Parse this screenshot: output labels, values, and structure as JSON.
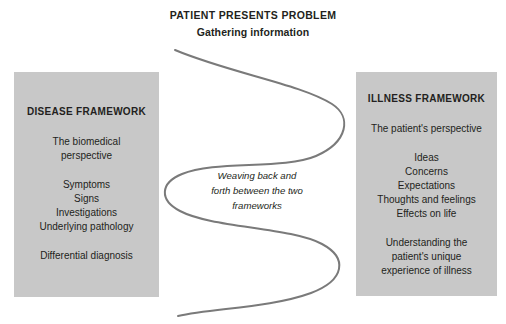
{
  "header": {
    "title": "PATIENT PRESENTS PROBLEM",
    "subtitle": "Gathering information"
  },
  "disease_framework": {
    "title": "DISEASE FRAMEWORK",
    "lead_line1": "The biomedical",
    "lead_line2": "perspective",
    "items": [
      "Symptoms",
      "Signs",
      "Investigations",
      "Underlying pathology"
    ],
    "note": "Differential diagnosis"
  },
  "illness_framework": {
    "title": "ILLNESS FRAMEWORK",
    "lead": "The patient's perspective",
    "items": [
      "Ideas",
      "Concerns",
      "Expectations",
      "Thoughts and feelings",
      "Effects on life"
    ],
    "note_line1": "Understanding the",
    "note_line2": "patient's unique",
    "note_line3": "experience of illness"
  },
  "center_caption": {
    "line1": "Weaving back and",
    "line2": "forth between the two",
    "line3": "frameworks"
  },
  "colors": {
    "panel_fill": "#c8c8c8",
    "text": "#231f20",
    "curve_stroke": "#7a7a7a",
    "background": "#ffffff"
  },
  "curve": {
    "name": "weaving-s-curve",
    "stroke_width": 2
  }
}
